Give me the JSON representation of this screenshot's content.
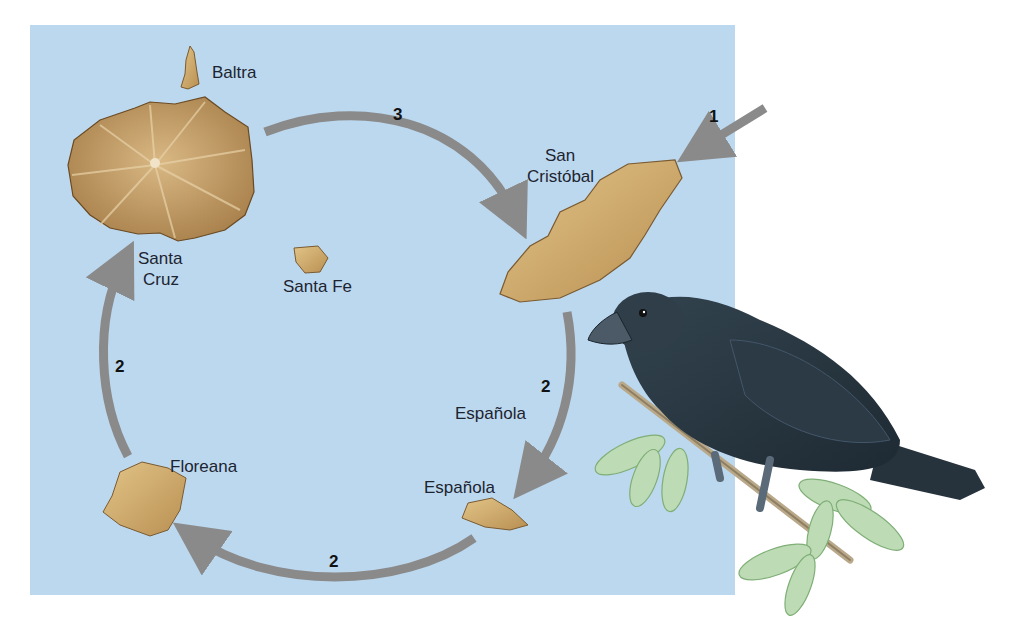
{
  "figure": {
    "colors": {
      "sea": "#bcd8ef",
      "island": "#c9a262",
      "island_dark": "#a07a45",
      "arrow": "#8a8a8a",
      "finch": "#2c3a44",
      "leaf": "#b9d9b0"
    }
  },
  "islands": [
    {
      "id": "baltra",
      "label": "Baltra"
    },
    {
      "id": "santa-cruz",
      "label_line1": "Santa",
      "label_line2": "Cruz"
    },
    {
      "id": "santa-fe",
      "label": "Santa Fe"
    },
    {
      "id": "san-cristobal",
      "label_line1": "San",
      "label_line2": "Cristóbal"
    },
    {
      "id": "espanola-mid",
      "label": "Española"
    },
    {
      "id": "espanola",
      "label": "Española"
    },
    {
      "id": "floreana",
      "label": "Floreana"
    }
  ],
  "arrows": [
    {
      "id": "arrow-1",
      "step": "1",
      "from": "mainland",
      "to": "San Cristóbal"
    },
    {
      "id": "arrow-2-right",
      "step": "2",
      "from": "San Cristóbal",
      "to": "Española"
    },
    {
      "id": "arrow-2-bottom",
      "step": "2",
      "from": "Española",
      "to": "Floreana"
    },
    {
      "id": "arrow-2-left",
      "step": "2",
      "from": "Floreana",
      "to": "Santa Cruz"
    },
    {
      "id": "arrow-3",
      "step": "3",
      "from": "Santa Cruz",
      "to": "San Cristóbal"
    }
  ],
  "illustration": {
    "subject": "finch-on-branch"
  }
}
